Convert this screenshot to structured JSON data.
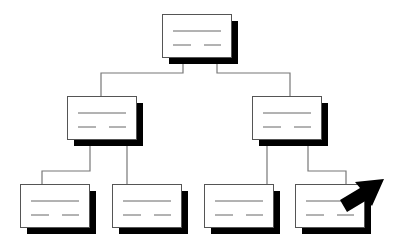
{
  "diagram": {
    "type": "hierarchy-tree",
    "colors": {
      "background": "#ffffff",
      "box_fill": "#ffffff",
      "box_stroke": "#555555",
      "shadow": "#000000",
      "connector": "#777777",
      "text_lines": "#666666",
      "arrow": "#000000"
    },
    "nodes": [
      {
        "id": "root",
        "x": 162,
        "y": 14,
        "w": 69,
        "h": 43,
        "level": 0
      },
      {
        "id": "mid-left",
        "x": 67,
        "y": 96,
        "w": 69,
        "h": 43,
        "level": 1
      },
      {
        "id": "mid-right",
        "x": 252,
        "y": 96,
        "w": 69,
        "h": 43,
        "level": 1
      },
      {
        "id": "leaf-1",
        "x": 20,
        "y": 184,
        "w": 69,
        "h": 43,
        "level": 2
      },
      {
        "id": "leaf-2",
        "x": 112,
        "y": 184,
        "w": 69,
        "h": 43,
        "level": 2
      },
      {
        "id": "leaf-3",
        "x": 204,
        "y": 184,
        "w": 69,
        "h": 43,
        "level": 2
      },
      {
        "id": "leaf-4",
        "x": 295,
        "y": 184,
        "w": 69,
        "h": 43,
        "level": 2
      }
    ],
    "connectors": [
      {
        "from": "root",
        "to": "mid-left",
        "points": "183,57 183,73 101,73 101,96"
      },
      {
        "from": "root",
        "to": "mid-right",
        "points": "217,57 217,73 290,73 290,96"
      },
      {
        "from": "mid-left",
        "to": "leaf-1",
        "points": "90,139 90,171 42,171 42,184"
      },
      {
        "from": "mid-left",
        "to": "leaf-2",
        "points": "127,139 127,184"
      },
      {
        "from": "mid-right",
        "to": "leaf-3",
        "points": "267,139 267,184"
      },
      {
        "from": "mid-right",
        "to": "leaf-4",
        "points": "308,139 308,171 346,171 346,184"
      }
    ],
    "cursor_arrow": {
      "target": "leaf-4",
      "points": "340,200 360,188 355,182 384,179 372,206 367,200 347,212"
    }
  }
}
